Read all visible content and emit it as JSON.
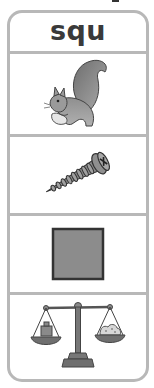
{
  "card": {
    "header_text": "squ",
    "items": [
      {
        "icon": "squirrel-icon",
        "word_hint": "squirrel"
      },
      {
        "icon": "screw-icon",
        "word_hint": "screw"
      },
      {
        "icon": "square-icon",
        "word_hint": "square"
      },
      {
        "icon": "scales-icon",
        "word_hint": "scales"
      }
    ]
  },
  "colors": {
    "border": "#b8b8b8",
    "text": "#3a3a3a",
    "fill_gray": "#8c8c8c",
    "outline": "#333333"
  }
}
